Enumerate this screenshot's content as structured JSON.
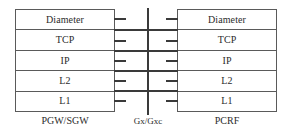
{
  "diagram": {
    "layers": [
      "Diameter",
      "TCP",
      "IP",
      "L2",
      "L1"
    ],
    "nodes": {
      "left": {
        "caption": "PGW/SGW"
      },
      "right": {
        "caption": "PCRF"
      }
    },
    "interface": {
      "caption": "Gx/Gxc"
    },
    "colors": {
      "border": "#5a5a5a",
      "line": "#3a3a3a",
      "text": "#2b2b2b",
      "background": "#ffffff"
    }
  }
}
